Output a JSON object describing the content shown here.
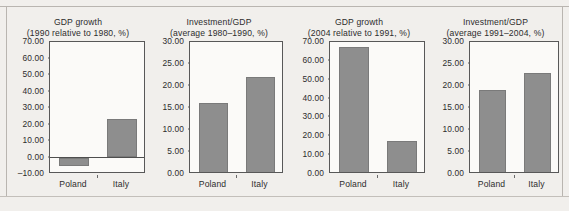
{
  "figure": {
    "background_color": "#f1efec",
    "bar_color": "#8e8e8e",
    "axis_color": "#585858",
    "text_color": "#2d2d2d"
  },
  "chart_data": [
    {
      "type": "bar",
      "title": "GDP growth",
      "subtitle": "(1990 relative to 1980, %)",
      "categories": [
        "Poland",
        "Italy"
      ],
      "values": [
        -5.0,
        23.5
      ],
      "ylim": [
        -10,
        70
      ],
      "ytick_values": [
        -10,
        0,
        10,
        20,
        30,
        40,
        50,
        60,
        70
      ],
      "ytick_labels": [
        "–10.00",
        "0.00",
        "10.00",
        "20.00",
        "30.00",
        "40.00",
        "50.00",
        "60.00",
        "70.00"
      ],
      "xlabel": "",
      "ylabel": "",
      "grid": false,
      "legend": "none"
    },
    {
      "type": "bar",
      "title": "Investment/GDP",
      "subtitle": "(average 1980–1990, %)",
      "categories": [
        "Poland",
        "Italy"
      ],
      "values": [
        16.2,
        22.1
      ],
      "ylim": [
        0,
        30
      ],
      "ytick_values": [
        0,
        5,
        10,
        15,
        20,
        25,
        30
      ],
      "ytick_labels": [
        "0.00",
        "5.00",
        "10.00",
        "15.00",
        "20.00",
        "25.00",
        "30.00"
      ],
      "xlabel": "",
      "ylabel": "",
      "grid": false,
      "legend": "none"
    },
    {
      "type": "bar",
      "title": "GDP growth",
      "subtitle": "(2004 relative to 1991, %)",
      "categories": [
        "Poland",
        "Italy"
      ],
      "values": [
        67.5,
        17.5
      ],
      "ylim": [
        0,
        70
      ],
      "ytick_values": [
        0,
        10,
        20,
        30,
        40,
        50,
        60,
        70
      ],
      "ytick_labels": [
        "0.00",
        "10.00",
        "20.00",
        "30.00",
        "40.00",
        "50.00",
        "60.00",
        "70.00"
      ],
      "xlabel": "",
      "ylabel": "",
      "grid": false,
      "legend": "none"
    },
    {
      "type": "bar",
      "title": "Investment/GDP",
      "subtitle": "(average 1991–2004, %)",
      "categories": [
        "Poland",
        "Italy"
      ],
      "values": [
        19.0,
        23.0
      ],
      "ylim": [
        0,
        30
      ],
      "ytick_values": [
        0,
        5,
        10,
        15,
        20,
        25,
        30
      ],
      "ytick_labels": [
        "0.00",
        "5.00",
        "10.00",
        "15.00",
        "20.00",
        "25.00",
        "30.00"
      ],
      "xlabel": "",
      "ylabel": "",
      "grid": false,
      "legend": "none"
    }
  ]
}
